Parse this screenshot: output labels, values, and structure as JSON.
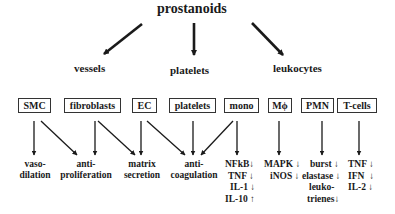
{
  "root": "prostanoids",
  "categories": [
    {
      "label": "vessels"
    },
    {
      "label": "platelets"
    },
    {
      "label": "leukocytes"
    }
  ],
  "cells": [
    {
      "label": "SMC"
    },
    {
      "label": "fibroblasts"
    },
    {
      "label": "EC"
    },
    {
      "label": "platelets"
    },
    {
      "label": "mono"
    },
    {
      "label": "Mϕ"
    },
    {
      "label": "PMN"
    },
    {
      "label": "T-cells"
    }
  ],
  "effects": {
    "vasodilation": {
      "line1": "vaso-",
      "line2": "dilation"
    },
    "antiproliferation": {
      "line1": "anti-",
      "line2": "proliferation"
    },
    "matrix_secretion": {
      "line1": "matrix",
      "line2": "secretion"
    },
    "anticoagulation": {
      "line1": "anti-",
      "line2": "coagulation"
    }
  },
  "mono_effects": [
    {
      "name": "NFkB",
      "dir": "↓"
    },
    {
      "name": "TNF",
      "dir": "↓"
    },
    {
      "name": "IL-1",
      "dir": "↓"
    },
    {
      "name": "IL-10",
      "dir": "↑"
    }
  ],
  "macrophage_effects": [
    {
      "name": "MAPK",
      "dir": "↓"
    },
    {
      "name": "iNOS",
      "dir": "↓"
    }
  ],
  "pmn_effects": [
    {
      "name": "burst",
      "dir": "↓"
    },
    {
      "name": "elastase",
      "dir": "↓"
    },
    {
      "name": "leuko-",
      "dir": ""
    },
    {
      "name": "trienes",
      "dir": "↓"
    }
  ],
  "tcell_effects": [
    {
      "name": "TNF",
      "dir": "↓"
    },
    {
      "name": "IFN",
      "dir": "↓"
    },
    {
      "name": "IL-2",
      "dir": "↓"
    }
  ]
}
